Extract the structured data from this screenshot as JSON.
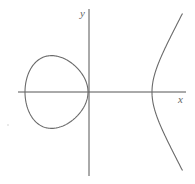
{
  "diagram": {
    "type": "elliptic-curve-plot",
    "equation_form": "y^2 = (x - e1)(x - e2)(x - e3)",
    "axes": {
      "x_label": "x",
      "y_label": "y"
    },
    "components": [
      {
        "name": "bounded oval",
        "x_range_px": [
          25,
          88
        ]
      },
      {
        "name": "unbounded branch",
        "vertex_px": [
          152,
          92
        ]
      }
    ],
    "roots_px_offset": [
      -64,
      -1,
      63
    ],
    "scale_k": 0.01361
  },
  "colors": {
    "axis": "#555555",
    "curve": "#6a6a6a",
    "label": "#666666",
    "background": "#ffffff"
  }
}
